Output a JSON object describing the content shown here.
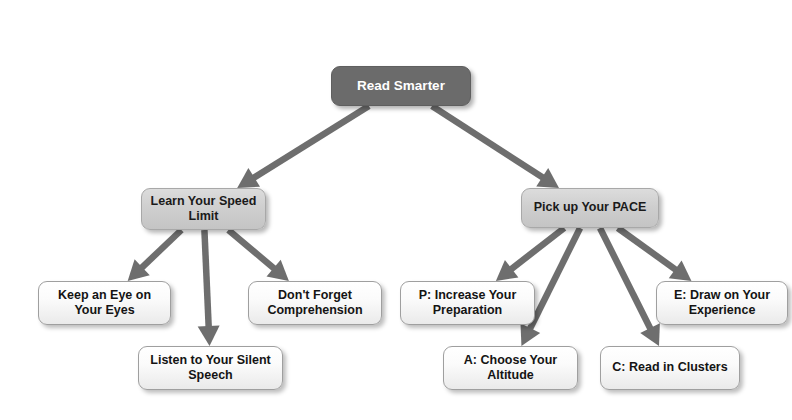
{
  "diagram": {
    "title": "Read Smarter",
    "type": "flowchart",
    "background_color": "#ffffff",
    "arrow_color": "#6e6e6e",
    "colors": {
      "root_fill": "#6b6b6b",
      "root_text": "#ffffff",
      "branch_fill": "#cfcfcf",
      "branch_text": "#1a1a1a",
      "leaf_fill": "#f7f7f7",
      "leaf_text": "#141414",
      "border": "#9f9f9f"
    },
    "nodes": [
      {
        "id": "root",
        "label": "Read Smarter",
        "level": "root",
        "x": 331,
        "y": 66,
        "w": 140,
        "h": 40
      },
      {
        "id": "branch-speed-limit",
        "label": "Learn Your Speed\nLimit",
        "level": "branch",
        "x": 141,
        "y": 188,
        "w": 125,
        "h": 42
      },
      {
        "id": "branch-pace",
        "label": "Pick up Your PACE",
        "level": "branch",
        "x": 521,
        "y": 188,
        "w": 138,
        "h": 40
      },
      {
        "id": "leaf-keep-an-eye",
        "label": "Keep an Eye on\nYour Eyes",
        "level": "leaf",
        "x": 38,
        "y": 281,
        "w": 133,
        "h": 44
      },
      {
        "id": "leaf-listen-silent-speech",
        "label": "Listen to Your Silent\nSpeech",
        "level": "leaf",
        "x": 138,
        "y": 346,
        "w": 145,
        "h": 44
      },
      {
        "id": "leaf-dont-forget-comprehension",
        "label": "Don't Forget\nComprehension",
        "level": "leaf",
        "x": 248,
        "y": 281,
        "w": 134,
        "h": 44
      },
      {
        "id": "leaf-p-preparation",
        "label": "P: Increase Your\nPreparation",
        "level": "leaf",
        "x": 400,
        "y": 281,
        "w": 135,
        "h": 44
      },
      {
        "id": "leaf-a-altitude",
        "label": "A: Choose Your\nAltitude",
        "level": "leaf",
        "x": 443,
        "y": 346,
        "w": 135,
        "h": 44
      },
      {
        "id": "leaf-c-clusters",
        "label": "C: Read in Clusters",
        "level": "leaf",
        "x": 600,
        "y": 346,
        "w": 140,
        "h": 44
      },
      {
        "id": "leaf-e-experience",
        "label": "E: Draw on Your\nExperience",
        "level": "leaf",
        "x": 656,
        "y": 281,
        "w": 132,
        "h": 44
      }
    ],
    "edges": [
      {
        "id": "edge-root-to-speed-limit",
        "from": "root",
        "to": "branch-speed-limit"
      },
      {
        "id": "edge-root-to-pace",
        "from": "root",
        "to": "branch-pace"
      },
      {
        "id": "edge-speed-limit-to-keep-an-eye",
        "from": "branch-speed-limit",
        "to": "leaf-keep-an-eye"
      },
      {
        "id": "edge-speed-limit-to-listen-silent-speech",
        "from": "branch-speed-limit",
        "to": "leaf-listen-silent-speech"
      },
      {
        "id": "edge-speed-limit-to-dont-forget-comprehension",
        "from": "branch-speed-limit",
        "to": "leaf-dont-forget-comprehension"
      },
      {
        "id": "edge-pace-to-p-preparation",
        "from": "branch-pace",
        "to": "leaf-p-preparation"
      },
      {
        "id": "edge-pace-to-a-altitude",
        "from": "branch-pace",
        "to": "leaf-a-altitude"
      },
      {
        "id": "edge-pace-to-c-clusters",
        "from": "branch-pace",
        "to": "leaf-c-clusters"
      },
      {
        "id": "edge-pace-to-e-experience",
        "from": "branch-pace",
        "to": "leaf-e-experience"
      }
    ]
  }
}
